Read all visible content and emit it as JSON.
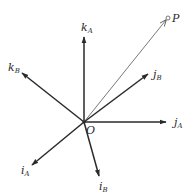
{
  "diagram": {
    "type": "coordinate-frames",
    "origin": {
      "label": "O",
      "x": 84,
      "y": 122
    },
    "point": {
      "label": "P",
      "x": 168,
      "y": 18
    },
    "axes": [
      {
        "id": "kA",
        "base": "k",
        "sub": "A",
        "tip": [
          84,
          37
        ],
        "label_pos": [
          82,
          32
        ],
        "weight": "bold"
      },
      {
        "id": "kB",
        "base": "k",
        "sub": "B",
        "tip": [
          22,
          73
        ],
        "label_pos": [
          8,
          72
        ],
        "weight": "bold"
      },
      {
        "id": "jB",
        "base": "j",
        "sub": "B",
        "tip": [
          148,
          74
        ],
        "label_pos": [
          153,
          79
        ],
        "weight": "bold"
      },
      {
        "id": "jA",
        "base": "j",
        "sub": "A",
        "tip": [
          166,
          122
        ],
        "label_pos": [
          174,
          127
        ],
        "weight": "bold"
      },
      {
        "id": "iA",
        "base": "i",
        "sub": "A",
        "tip": [
          32,
          165
        ],
        "label_pos": [
          20,
          176
        ],
        "weight": "bold"
      },
      {
        "id": "iB",
        "base": "i",
        "sub": "B",
        "tip": [
          99,
          176
        ],
        "label_pos": [
          98,
          191
        ],
        "weight": "bold"
      }
    ],
    "vector": {
      "from": "O",
      "to": "P",
      "weight": "thin"
    },
    "colors": {
      "stroke": "#2a2a2a",
      "thin": "#555555",
      "background": "#ffffff"
    }
  }
}
